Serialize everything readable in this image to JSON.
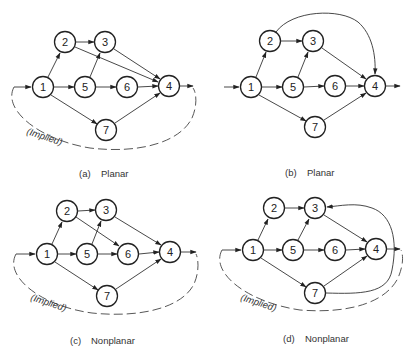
{
  "figure": {
    "panels": [
      {
        "id": "a",
        "caption_letter": "(a)",
        "caption_text": "Planar",
        "implied_label": "(Implied)",
        "has_implied_arc": true,
        "nodes": [
          {
            "id": "1",
            "x": 43,
            "y": 87
          },
          {
            "id": "2",
            "x": 65,
            "y": 42
          },
          {
            "id": "3",
            "x": 105,
            "y": 42
          },
          {
            "id": "5",
            "x": 85,
            "y": 87
          },
          {
            "id": "6",
            "x": 127,
            "y": 87
          },
          {
            "id": "4",
            "x": 169,
            "y": 86
          },
          {
            "id": "7",
            "x": 106,
            "y": 130
          }
        ],
        "edges": [
          [
            "1",
            "2"
          ],
          [
            "2",
            "3"
          ],
          [
            "2",
            "4"
          ],
          [
            "1",
            "5"
          ],
          [
            "5",
            "3"
          ],
          [
            "3",
            "4"
          ],
          [
            "5",
            "6"
          ],
          [
            "6",
            "4"
          ],
          [
            "1",
            "7"
          ],
          [
            "7",
            "4"
          ]
        ]
      },
      {
        "id": "b",
        "caption_letter": "(b)",
        "caption_text": "Planar",
        "implied_label": "",
        "has_implied_arc": false,
        "nodes": [
          {
            "id": "1",
            "x": 251,
            "y": 87
          },
          {
            "id": "2",
            "x": 270,
            "y": 41
          },
          {
            "id": "3",
            "x": 313,
            "y": 41
          },
          {
            "id": "5",
            "x": 293,
            "y": 87
          },
          {
            "id": "6",
            "x": 335,
            "y": 86
          },
          {
            "id": "4",
            "x": 375,
            "y": 86
          },
          {
            "id": "7",
            "x": 315,
            "y": 127
          }
        ],
        "edges": [
          [
            "1",
            "2"
          ],
          [
            "2",
            "3"
          ],
          [
            "2",
            "4",
            "curved-over-top"
          ],
          [
            "1",
            "5"
          ],
          [
            "5",
            "3"
          ],
          [
            "3",
            "4"
          ],
          [
            "5",
            "6"
          ],
          [
            "6",
            "4"
          ],
          [
            "1",
            "7"
          ],
          [
            "7",
            "4"
          ]
        ]
      },
      {
        "id": "c",
        "caption_letter": "(c)",
        "caption_text": "Nonplanar",
        "implied_label": "(Implied)",
        "has_implied_arc": true,
        "nodes": [
          {
            "id": "1",
            "x": 47,
            "y": 254
          },
          {
            "id": "2",
            "x": 67,
            "y": 211
          },
          {
            "id": "3",
            "x": 106,
            "y": 210
          },
          {
            "id": "5",
            "x": 87,
            "y": 254
          },
          {
            "id": "6",
            "x": 128,
            "y": 254
          },
          {
            "id": "4",
            "x": 170,
            "y": 252
          },
          {
            "id": "7",
            "x": 107,
            "y": 296
          }
        ],
        "edges": [
          [
            "1",
            "2"
          ],
          [
            "2",
            "3"
          ],
          [
            "2",
            "6"
          ],
          [
            "1",
            "5"
          ],
          [
            "5",
            "3"
          ],
          [
            "3",
            "4"
          ],
          [
            "5",
            "6"
          ],
          [
            "6",
            "4"
          ],
          [
            "1",
            "7"
          ],
          [
            "7",
            "4"
          ]
        ]
      },
      {
        "id": "d",
        "caption_letter": "(d)",
        "caption_text": "Nonplanar",
        "implied_label": "(Implied)",
        "has_implied_arc": true,
        "nodes": [
          {
            "id": "1",
            "x": 253,
            "y": 250
          },
          {
            "id": "2",
            "x": 274,
            "y": 208
          },
          {
            "id": "3",
            "x": 315,
            "y": 208
          },
          {
            "id": "5",
            "x": 293,
            "y": 250
          },
          {
            "id": "6",
            "x": 335,
            "y": 250
          },
          {
            "id": "4",
            "x": 376,
            "y": 249
          },
          {
            "id": "7",
            "x": 315,
            "y": 293
          }
        ],
        "edges": [
          [
            "1",
            "2"
          ],
          [
            "2",
            "3"
          ],
          [
            "1",
            "5"
          ],
          [
            "5",
            "3"
          ],
          [
            "3",
            "4"
          ],
          [
            "5",
            "6"
          ],
          [
            "6",
            "4"
          ],
          [
            "1",
            "7"
          ],
          [
            "7",
            "4"
          ],
          [
            "7",
            "3",
            "curved-around-right"
          ]
        ]
      }
    ]
  }
}
